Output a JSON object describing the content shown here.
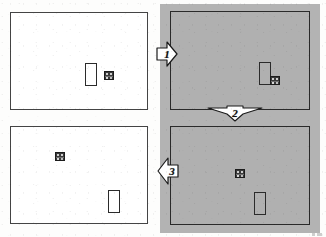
{
  "figure": {
    "kind": "four-panel-state-diagram",
    "background_color": "#ffffff",
    "shaded_backdrop_color": "#b3b3b3"
  },
  "panels": [
    {
      "id": "panel-top-left",
      "shading": "light",
      "fill_color": "#ffffff",
      "border_color": "#444444",
      "objects": [
        {
          "type": "tall-rectangle",
          "name": "tall-rectangle",
          "fill": "#ffffff"
        },
        {
          "type": "small-square",
          "name": "small-square-icon",
          "fill": "#3a3a3a"
        }
      ]
    },
    {
      "id": "panel-top-right",
      "shading": "shaded",
      "fill_color": "#b0b0b0",
      "border_color": "#2a2a2a",
      "objects": [
        {
          "type": "tall-rectangle",
          "name": "tall-rectangle",
          "fill": "transparent"
        },
        {
          "type": "small-square",
          "name": "small-square-icon",
          "fill": "#3a3a3a"
        }
      ]
    },
    {
      "id": "panel-bottom-left",
      "shading": "light",
      "fill_color": "#ffffff",
      "border_color": "#444444",
      "objects": [
        {
          "type": "small-square",
          "name": "small-square-icon",
          "fill": "#3a3a3a"
        },
        {
          "type": "tall-rectangle",
          "name": "tall-rectangle",
          "fill": "#ffffff"
        }
      ]
    },
    {
      "id": "panel-bottom-right",
      "shading": "shaded",
      "fill_color": "#b0b0b0",
      "border_color": "#2a2a2a",
      "objects": [
        {
          "type": "small-square",
          "name": "small-square-icon",
          "fill": "#3a3a3a"
        },
        {
          "type": "tall-rectangle",
          "name": "tall-rectangle",
          "fill": "transparent"
        }
      ]
    }
  ],
  "arrows": [
    {
      "id": "arrow-1",
      "label": "1",
      "direction": "right",
      "from": "panel-top-left",
      "to": "panel-top-right"
    },
    {
      "id": "arrow-2",
      "label": "2",
      "direction": "down",
      "from": "panel-top-right",
      "to": "panel-bottom-right"
    },
    {
      "id": "arrow-3",
      "label": "3",
      "direction": "left",
      "from": "panel-bottom-right",
      "to": "panel-bottom-left"
    }
  ]
}
